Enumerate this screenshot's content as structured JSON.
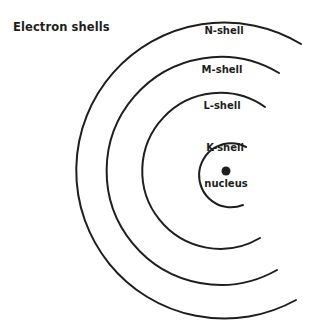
{
  "title": "Electron shells",
  "shells": [
    {
      "name": "N-shell",
      "radius": 148
    },
    {
      "name": "M-shell",
      "radius": 114
    },
    {
      "name": "L-shell",
      "radius": 78
    },
    {
      "name": "K-shell",
      "radius": 32
    }
  ],
  "nucleus": {
    "label": "nucleus"
  },
  "colors": {
    "line": "#1e1e1e",
    "background": "#ffffff"
  }
}
